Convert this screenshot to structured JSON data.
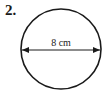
{
  "problem": {
    "number": "2.",
    "shape": "circle",
    "dimension_label": "8 cm",
    "dimension_type": "diameter"
  },
  "colors": {
    "stroke": "#1a1a1a",
    "background": "#ffffff"
  }
}
